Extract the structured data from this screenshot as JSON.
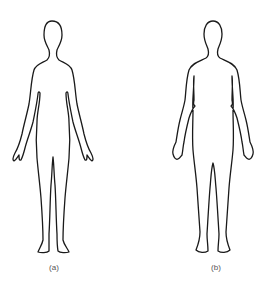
{
  "figures": [
    {
      "id": "a",
      "label": "(a)",
      "description": "Slim body outline, front view"
    },
    {
      "id": "b",
      "label": "(b)",
      "description": "Fuller body outline, front view"
    }
  ],
  "colors": {
    "outline": "#1a1a1a",
    "label": "#555555",
    "background": "#ffffff"
  }
}
